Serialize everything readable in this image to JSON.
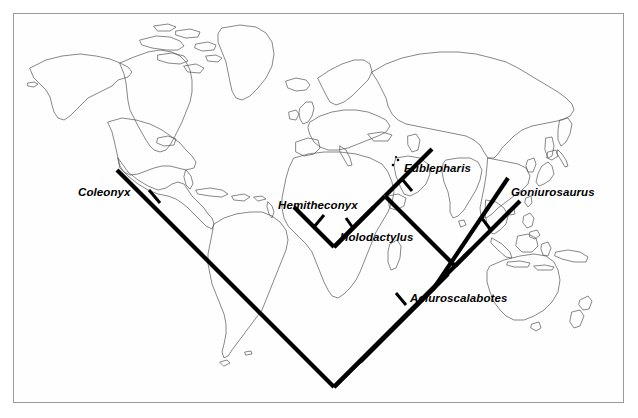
{
  "figure": {
    "kind": "phylogenetic-cladogram-on-world-map",
    "background_color": "#ffffff",
    "frame_color": "#9a9a9a",
    "map_outline_color": "#4a4a4a",
    "tree_color": "#000000"
  },
  "tree": {
    "taxa": [
      {
        "id": "coleonyx",
        "label": "Coleonyx",
        "label_x": 78,
        "label_y": 186
      },
      {
        "id": "hemitheconyx",
        "label": "Hemitheconyx",
        "label_x": 278,
        "label_y": 199
      },
      {
        "id": "holodactylus",
        "label": "Holodactylus",
        "label_x": 340,
        "label_y": 231
      },
      {
        "id": "eublepharis",
        "label": "Eublepharis",
        "label_x": 404,
        "label_y": 162
      },
      {
        "id": "goniurosaurus",
        "label": "Goniurosaurus",
        "label_x": 511,
        "label_y": 186
      },
      {
        "id": "aeluroscalabotes",
        "label": "Aeluroscalabotes",
        "label_x": 410,
        "label_y": 298
      }
    ],
    "newick": "(Coleonyx,(((Hemitheconyx,Holodactylus),Eublepharis),(Goniurosaurus,Aeluroscalabotes)));"
  },
  "map": {
    "regions": [
      "North America",
      "South America",
      "Greenland",
      "Iceland",
      "Europe",
      "Africa",
      "Madagascar",
      "Asia",
      "Japan",
      "Southeast Asia",
      "Australia",
      "New Zealand"
    ]
  }
}
